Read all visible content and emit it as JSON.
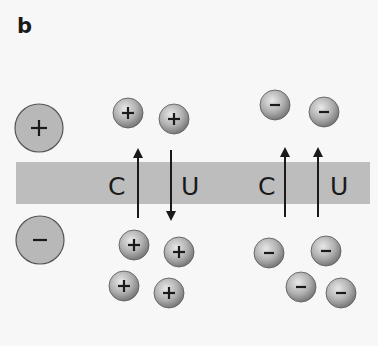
{
  "panel": {
    "label": "b"
  },
  "colors": {
    "background": "#f7f7f7",
    "membrane": "#bdbdbd",
    "large_ion_fill": "#b8b8b8",
    "ion_outline": "#555555",
    "arrow": "#1a1a1a",
    "text": "#1a1a1a"
  },
  "membrane": {
    "x": 16,
    "y": 162,
    "width": 354,
    "height": 42
  },
  "legend_ions": [
    {
      "charge": "+",
      "name": "large-cation",
      "cx": 39,
      "cy": 128,
      "r": 24
    },
    {
      "charge": "-",
      "name": "large-anion",
      "cx": 40,
      "cy": 240,
      "r": 24
    }
  ],
  "cation_group": {
    "labels": {
      "coupled": "C",
      "uncoupled": "U"
    },
    "label_positions": {
      "coupled": {
        "x": 116,
        "y": 195
      },
      "uncoupled": {
        "x": 190,
        "y": 195
      }
    },
    "arrows": [
      {
        "name": "coupled-arrow",
        "direction": "up",
        "x": 138,
        "y_tip": 151,
        "y_tail": 218
      },
      {
        "name": "uncoupled-arrow",
        "direction": "down",
        "x": 171,
        "y_tip": 218,
        "y_tail": 150
      }
    ],
    "ions_top": [
      {
        "cx": 128,
        "cy": 113
      },
      {
        "cx": 174,
        "cy": 119
      }
    ],
    "ions_bottom": [
      {
        "cx": 134,
        "cy": 245
      },
      {
        "cx": 179,
        "cy": 252
      },
      {
        "cx": 124,
        "cy": 286
      },
      {
        "cx": 169,
        "cy": 293
      }
    ]
  },
  "anion_group": {
    "labels": {
      "coupled": "C",
      "uncoupled": "U"
    },
    "label_positions": {
      "coupled": {
        "x": 267,
        "y": 195
      },
      "uncoupled": {
        "x": 340,
        "y": 195
      }
    },
    "arrows": [
      {
        "name": "coupled-arrow",
        "direction": "up",
        "x": 285,
        "y_tip": 150,
        "y_tail": 217
      },
      {
        "name": "uncoupled-arrow",
        "direction": "up",
        "x": 318,
        "y_tip": 150,
        "y_tail": 217
      }
    ],
    "ions_top": [
      {
        "cx": 275,
        "cy": 105
      },
      {
        "cx": 324,
        "cy": 112
      }
    ],
    "ions_bottom": [
      {
        "cx": 269,
        "cy": 253
      },
      {
        "cx": 326,
        "cy": 251
      },
      {
        "cx": 301,
        "cy": 287
      },
      {
        "cx": 341,
        "cy": 293
      }
    ]
  },
  "small_ion_radius": 15
}
